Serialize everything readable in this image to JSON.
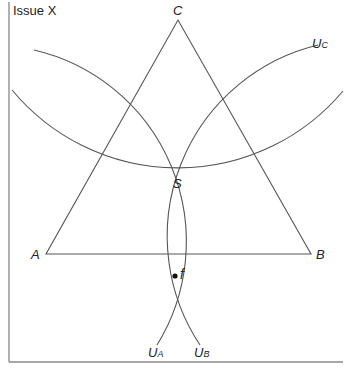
{
  "axis": {
    "y_label": "Issue X"
  },
  "triangle": {
    "vertices": [
      {
        "name": "A",
        "x": 46,
        "y": 254
      },
      {
        "name": "B",
        "x": 311,
        "y": 254
      },
      {
        "name": "C",
        "x": 178,
        "y": 20
      }
    ]
  },
  "points": {
    "S": {
      "label": "S",
      "x": 178,
      "y": 168
    },
    "f": {
      "label": "f",
      "x": 175,
      "y": 276
    }
  },
  "curves": {
    "U_A": {
      "label": "U",
      "sub": "A"
    },
    "U_B": {
      "label": "U",
      "sub": "B"
    },
    "U_C": {
      "label": "U",
      "sub": "C"
    }
  },
  "colors": {
    "line": "#555555",
    "axis": "#888888",
    "text": "#222222"
  }
}
